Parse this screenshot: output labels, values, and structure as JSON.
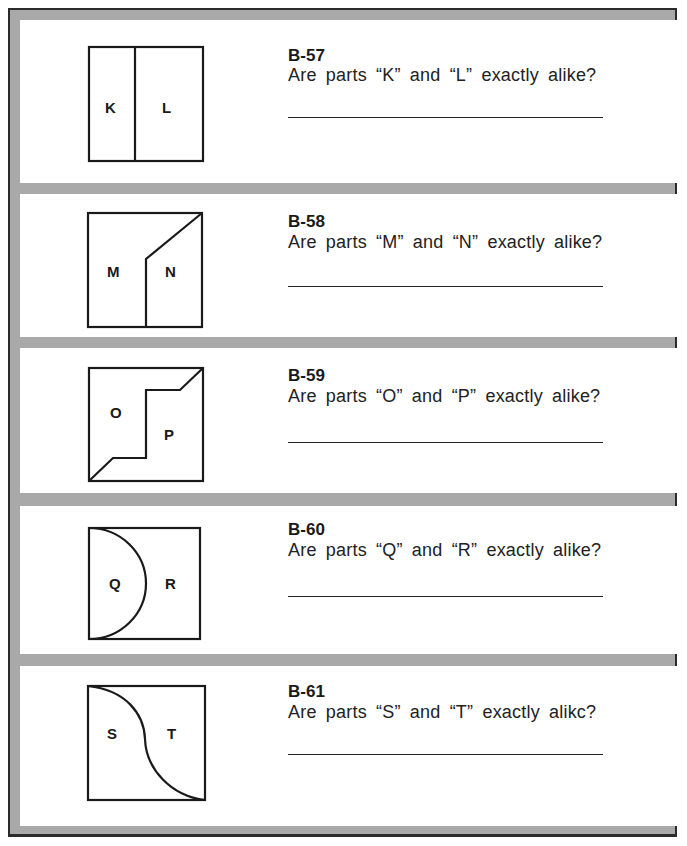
{
  "worksheet": {
    "questions": [
      {
        "id": "B-57",
        "text": "Are parts “K” and “L” exactly alike?",
        "parts": [
          "K",
          "L"
        ],
        "figure": "rectangle split by vertical line",
        "answer": ""
      },
      {
        "id": "B-58",
        "text": "Are parts “M” and “N” exactly alike?",
        "parts": [
          "M",
          "N"
        ],
        "figure": "square split by vertical line then diagonal to top-right",
        "answer": ""
      },
      {
        "id": "B-59",
        "text": "Are parts “O” and “P” exactly alike?",
        "parts": [
          "O",
          "P"
        ],
        "figure": "square split by stepped line corner to corner",
        "answer": ""
      },
      {
        "id": "B-60",
        "text": "Are parts “Q” and “R” exactly alike?",
        "parts": [
          "Q",
          "R"
        ],
        "figure": "square with semicircle on left side",
        "answer": ""
      },
      {
        "id": "B-61",
        "text": "Are parts “S” and “T” exactly alikc?",
        "parts": [
          "S",
          "T"
        ],
        "figure": "square split by S-curve corner to corner",
        "answer": ""
      }
    ]
  },
  "colors": {
    "frame": "#a9a9a9",
    "border": "#2b2b2b",
    "ink": "#1a1a1a",
    "paper": "#ffffff"
  }
}
